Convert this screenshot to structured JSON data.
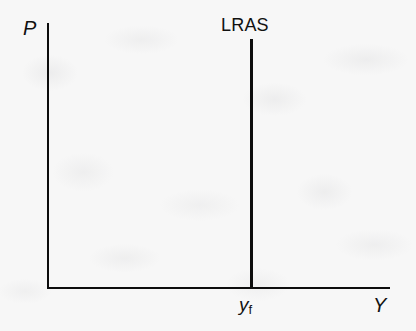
{
  "figure": {
    "type": "economics-diagram",
    "background_color": "#f7f7f7",
    "ink_color": "#0d0d0d",
    "width": 416,
    "height": 331
  },
  "axes": {
    "y_axis": {
      "label": "P",
      "name": "price-level"
    },
    "x_axis": {
      "label": "Y",
      "name": "output"
    }
  },
  "curves": [
    {
      "label": "LRAS",
      "name": "long-run-aggregate-supply",
      "orientation": "vertical"
    }
  ],
  "marks": [
    {
      "label_base": "y",
      "label_sub": "f",
      "name": "full-employment-output",
      "axis": "x"
    }
  ],
  "chart_data": {
    "type": "line",
    "title": "",
    "xlabel": "Y",
    "ylabel": "P",
    "xlim": [
      0,
      1
    ],
    "ylim": [
      0,
      1
    ],
    "grid": false,
    "legend": "none",
    "series": [
      {
        "name": "LRAS",
        "x": [
          0.6,
          0.6
        ],
        "y": [
          0.0,
          0.94
        ]
      }
    ],
    "annotations": [
      {
        "text": "LRAS",
        "x": 0.6,
        "y": 1.0
      },
      {
        "text": "yf",
        "x": 0.6,
        "y": -0.06
      }
    ],
    "xticks": [
      0.6
    ],
    "xticklabels": [
      "yf"
    ],
    "yticks": [],
    "yticklabels": []
  }
}
